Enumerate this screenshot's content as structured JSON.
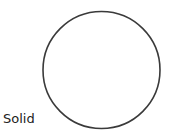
{
  "shape": {
    "type": "circle",
    "style_label": "Solid",
    "stroke_color": "#3a3a3a",
    "fill_color": "#ffffff",
    "cx": 101.5,
    "cy": 70,
    "r": 58.5,
    "stroke_width": 1.6
  }
}
